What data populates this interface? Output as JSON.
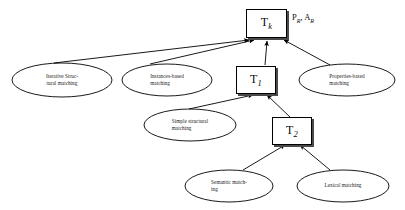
{
  "figure": {
    "type": "flow-diagram",
    "background_color": "#ffffff",
    "line_color": "#000000",
    "text_color": "#111111"
  },
  "boxes": {
    "tk": {
      "name": "T",
      "sub": "k",
      "side_label_main": "P",
      "side_label_main_sub": "R",
      "side_label_sep": ", ",
      "side_label_second": "A",
      "side_label_second_sub": "R"
    },
    "t1": {
      "name": "T",
      "sub": "1"
    },
    "t2": {
      "name": "T",
      "sub": "2"
    }
  },
  "ellipses": [
    {
      "id": "iterative-structural-matching",
      "line1": "Iterative    Struc-",
      "line2": "tural matching"
    },
    {
      "id": "instances-based-matching",
      "line1": "Instances-based",
      "line2": "matching"
    },
    {
      "id": "properties-based-matching",
      "line1": "Properties-based",
      "line2": "matching"
    },
    {
      "id": "simple-structural-matching",
      "line1": "Simple  structural",
      "line2": "matching"
    },
    {
      "id": "semantic-matching",
      "line1": "Semantic   match-",
      "line2": "ing"
    },
    {
      "id": "lexical-matching",
      "line1": "Lexical matching",
      "line2": ""
    }
  ],
  "edges": [
    {
      "from": "iterative-structural-matching",
      "to": "tk"
    },
    {
      "from": "instances-based-matching",
      "to": "tk"
    },
    {
      "from": "properties-based-matching",
      "to": "tk"
    },
    {
      "from": "t1",
      "to": "tk"
    },
    {
      "from": "simple-structural-matching",
      "to": "t1"
    },
    {
      "from": "t2",
      "to": "t1"
    },
    {
      "from": "semantic-matching",
      "to": "t2"
    },
    {
      "from": "lexical-matching",
      "to": "t2"
    }
  ]
}
